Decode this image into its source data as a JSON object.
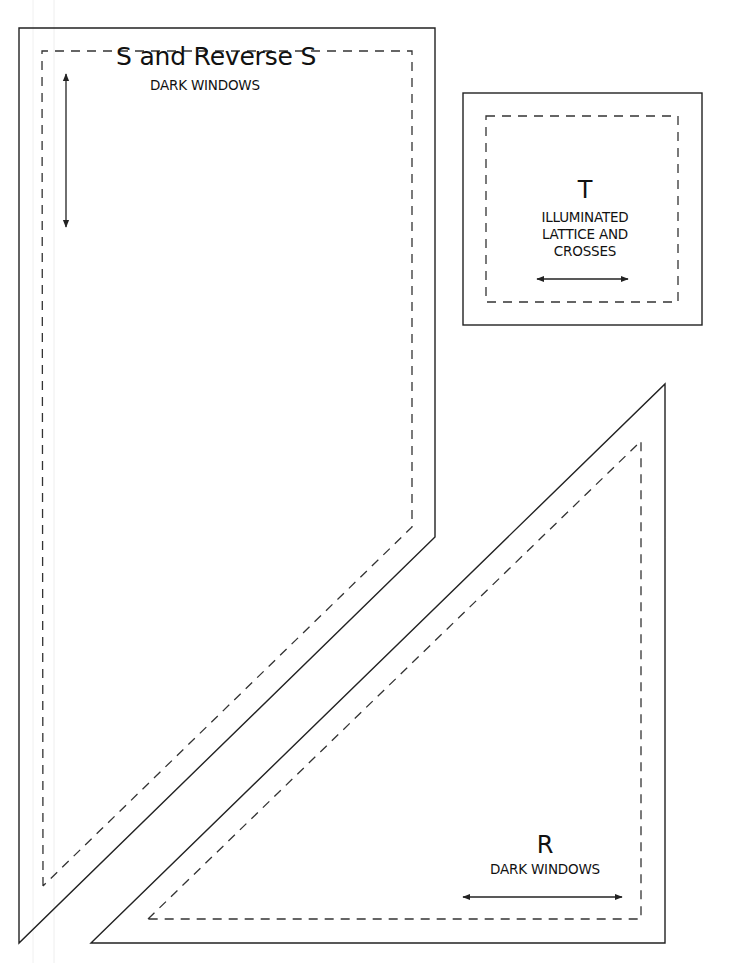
{
  "diagram": {
    "type": "quilt-template-pattern-pieces",
    "colors": {
      "stroke": "#222222",
      "background": "#ffffff",
      "guide": "#eeeeee"
    },
    "pieces": [
      {
        "id": "S",
        "title": "S and Reverse S",
        "subtitle": "DARK WINDOWS",
        "shape": "pentagon-trapezoid",
        "cut_line": [
          [
            19,
            28
          ],
          [
            435,
            28
          ],
          [
            435,
            537
          ],
          [
            19,
            943
          ]
        ],
        "seam_line": [
          [
            42,
            51
          ],
          [
            412,
            51
          ],
          [
            412,
            527
          ],
          [
            43,
            886
          ]
        ],
        "grain_arrow": {
          "orientation": "vertical",
          "from": [
            66,
            72
          ],
          "to": [
            66,
            229
          ]
        }
      },
      {
        "id": "T",
        "title": "T",
        "subtitle_lines": [
          "ILLUMINATED",
          "LATTICE AND",
          "CROSSES"
        ],
        "shape": "square",
        "cut_line": [
          [
            463,
            93
          ],
          [
            702,
            93
          ],
          [
            702,
            325
          ],
          [
            463,
            325
          ]
        ],
        "seam_line": [
          [
            486,
            116
          ],
          [
            678,
            116
          ],
          [
            678,
            302
          ],
          [
            486,
            302
          ]
        ],
        "grain_arrow": {
          "orientation": "horizontal",
          "from": [
            535,
            279
          ],
          "to": [
            630,
            279
          ]
        }
      },
      {
        "id": "R",
        "title": "R",
        "subtitle": "DARK WINDOWS",
        "shape": "right-triangle",
        "cut_line": [
          [
            91,
            943
          ],
          [
            665,
            384
          ],
          [
            665,
            943
          ]
        ],
        "seam_line": [
          [
            148,
            919
          ],
          [
            641,
            441
          ],
          [
            641,
            919
          ]
        ],
        "grain_arrow": {
          "orientation": "horizontal",
          "from": [
            461,
            897
          ],
          "to": [
            624,
            897
          ]
        }
      }
    ]
  }
}
